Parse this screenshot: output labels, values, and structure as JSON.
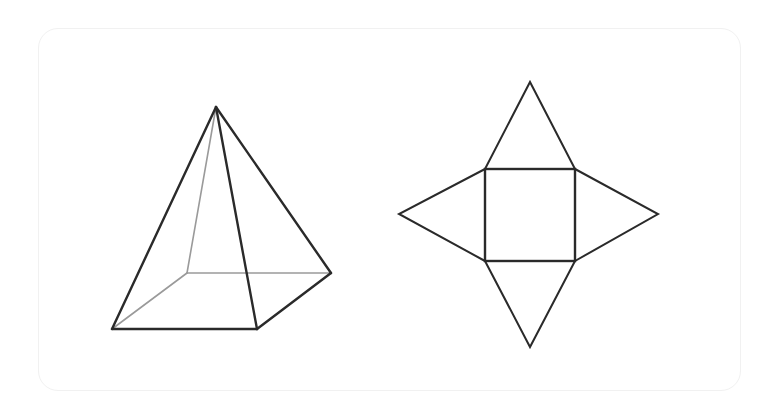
{
  "figure": {
    "pyramid": {
      "label": "square-pyramid",
      "apex": [
        216,
        107
      ],
      "base": {
        "front_left": [
          112,
          329
        ],
        "front_right": [
          257,
          329
        ],
        "back_right": [
          331,
          273
        ],
        "back_left": [
          187,
          273
        ]
      },
      "visible_edge_color": "#2a2a2a",
      "hidden_edge_color": "#9a9a9a"
    },
    "net": {
      "label": "square-pyramid-net",
      "square": {
        "x1": 485,
        "y1": 169,
        "x2": 575,
        "y2": 261
      },
      "triangle_apexes": {
        "top": [
          530,
          82
        ],
        "bottom": [
          530,
          347
        ],
        "left": [
          399,
          214
        ],
        "right": [
          658,
          214
        ]
      },
      "edge_color": "#2a2a2a"
    }
  }
}
